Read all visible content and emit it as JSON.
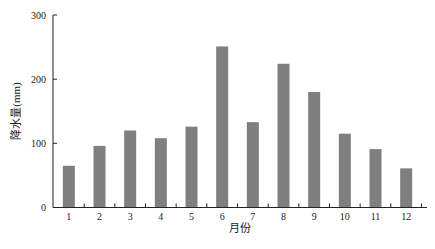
{
  "chart_data": {
    "type": "bar",
    "title": "",
    "xlabel": "月份",
    "ylabel": "降水量(mm)",
    "categories": [
      "1",
      "2",
      "3",
      "4",
      "5",
      "6",
      "7",
      "8",
      "9",
      "10",
      "11",
      "12"
    ],
    "values": [
      65,
      96,
      120,
      108,
      126,
      251,
      133,
      224,
      180,
      115,
      91,
      61
    ],
    "ylim": [
      0,
      300
    ],
    "yticks": [
      0,
      100,
      200,
      300
    ],
    "grid": false,
    "legend": null,
    "bar_color": "#7f7f7f"
  }
}
